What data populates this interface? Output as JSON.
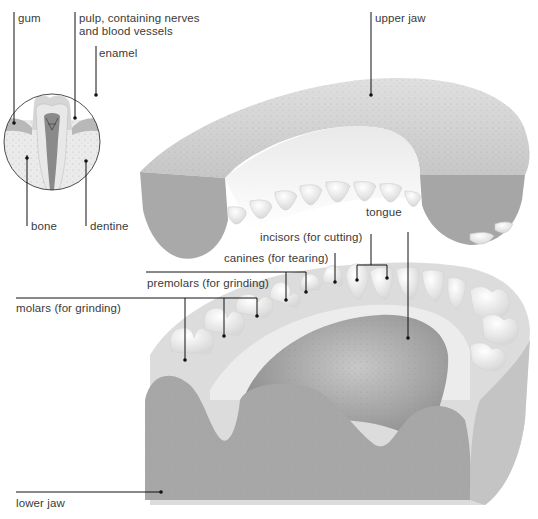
{
  "diagram": {
    "inset": {
      "description": "cross-section of a tooth",
      "labels": {
        "gum": "gum",
        "pulp": "pulp, containing nerves\nand blood vessels",
        "enamel": "enamel",
        "bone": "bone",
        "dentine": "dentine"
      }
    },
    "labels": {
      "upper_jaw": "upper jaw",
      "tongue": "tongue",
      "incisors": "incisors (for cutting)",
      "canines": "canines (for tearing)",
      "premolars": "premolars (for grinding)",
      "molars": "molars (for grinding)",
      "lower_jaw": "lower jaw"
    },
    "colors": {
      "jaw_cut": "#a8a8a8",
      "gum_top": "#d2d2d2",
      "tooth": "#f4f4f4",
      "tongue": "#9c9c9c",
      "leader_line": "#111111",
      "text": "#3a3a3a"
    }
  }
}
